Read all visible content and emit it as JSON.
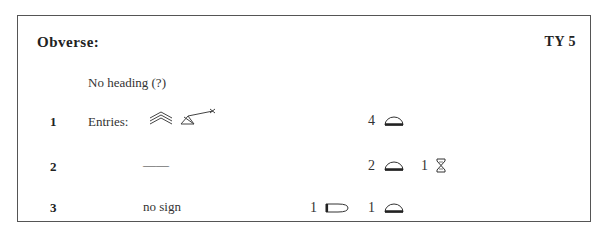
{
  "header": {
    "title": "Obverse:",
    "reference": "TY 5"
  },
  "note": "No heading (?)",
  "rows": [
    {
      "line": "1",
      "label": "Entries:",
      "signs": [
        "triple-chevron-sign",
        "triangle-arrow-sign"
      ],
      "groups": [
        {
          "count": "4",
          "sign": "half-dome-sign"
        }
      ]
    },
    {
      "line": "2",
      "label": "——",
      "groups": [
        {
          "count": "2",
          "sign": "half-dome-sign"
        },
        {
          "count": "1",
          "sign": "hourglass-sign"
        }
      ]
    },
    {
      "line": "3",
      "label": "no sign",
      "groups": [
        {
          "count": "1",
          "sign": "bullet-sign"
        },
        {
          "count": "1",
          "sign": "half-dome-sign"
        }
      ]
    }
  ]
}
